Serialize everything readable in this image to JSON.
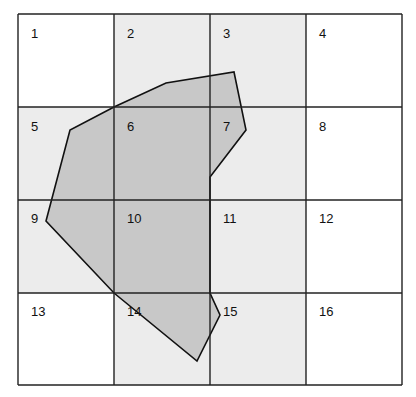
{
  "grid": {
    "x": [
      18,
      114,
      210,
      306,
      402
    ],
    "y": [
      14,
      107,
      200,
      293,
      385
    ],
    "cells": [
      {
        "label": "1",
        "shaded": false
      },
      {
        "label": "2",
        "shaded": true
      },
      {
        "label": "3",
        "shaded": true
      },
      {
        "label": "4",
        "shaded": false
      },
      {
        "label": "5",
        "shaded": true
      },
      {
        "label": "6",
        "shaded": true
      },
      {
        "label": "7",
        "shaded": true
      },
      {
        "label": "8",
        "shaded": false
      },
      {
        "label": "9",
        "shaded": true
      },
      {
        "label": "10",
        "shaded": true
      },
      {
        "label": "11",
        "shaded": true
      },
      {
        "label": "12",
        "shaded": false
      },
      {
        "label": "13",
        "shaded": false
      },
      {
        "label": "14",
        "shaded": true
      },
      {
        "label": "15",
        "shaded": true
      },
      {
        "label": "16",
        "shaded": false
      }
    ]
  },
  "polygon": {
    "points": "114,107 166,83 234,72 246,130 210,177 210,293 220,315 197,361 114,293 46,221 70,130",
    "fill": "#c8c8c8",
    "stroke": "#111111"
  },
  "colors": {
    "cell_shaded": "#ececec",
    "cell_white": "#ffffff",
    "grid_line": "#222222"
  }
}
